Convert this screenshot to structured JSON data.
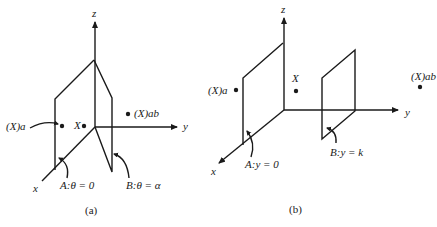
{
  "figure": {
    "panels": [
      {
        "id": "a",
        "caption": "(a)",
        "axes": {
          "z": "z",
          "y": "y",
          "x": "x"
        },
        "points": {
          "xa": "(X)a",
          "x": "X",
          "xab": "(X)ab"
        },
        "planes": {
          "A": "A:θ = 0",
          "B": "B:θ = α"
        }
      },
      {
        "id": "b",
        "caption": "(b)",
        "axes": {
          "z": "z",
          "y": "y",
          "x": "x"
        },
        "points": {
          "xa": "(X)a",
          "x": "X",
          "xab": "(X)ab"
        },
        "planes": {
          "A": "A:y = 0",
          "B": "B:y = k"
        }
      }
    ]
  }
}
